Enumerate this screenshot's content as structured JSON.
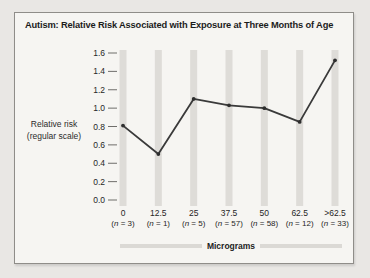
{
  "window": {
    "background": "#e9e7e4"
  },
  "panel": {
    "background": "#f6f5f2",
    "border_color": "#8f8d89"
  },
  "chart_data": {
    "type": "line",
    "title": "Autism: Relative Risk Associated with Exposure at Three Months of Age",
    "ylabel_lines": [
      "Relative risk",
      "(regular scale)"
    ],
    "xlabel": "Micrograms",
    "categories": [
      "0",
      "12.5",
      "25",
      "37.5",
      "50",
      "62.5",
      ">62.5"
    ],
    "n_labels": [
      "(n = 3)",
      "(n = 1)",
      "(n = 5)",
      "(n = 57)",
      "(n = 58)",
      "(n = 12)",
      "(n = 33)"
    ],
    "values": [
      0.81,
      0.5,
      1.1,
      1.03,
      1.0,
      0.85,
      1.52
    ],
    "yticks": [
      0.0,
      0.2,
      0.4,
      0.6,
      0.8,
      1.0,
      1.2,
      1.4,
      1.6
    ],
    "ylim": [
      0,
      1.6
    ],
    "grid": "vertical-bands",
    "legend": "none",
    "colors": {
      "line": "#3a3a3a",
      "marker": "#2e2e2e",
      "band": "#dedcd8",
      "tick_mark": "#6f6e6b",
      "text": "#262626",
      "xaxis_bar": "#dbd9d5"
    }
  }
}
